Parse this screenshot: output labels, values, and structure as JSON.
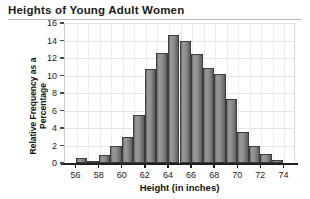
{
  "chart_data": {
    "type": "bar",
    "title": "Heights of Young Adult Women",
    "xlabel": "Height (in inches)",
    "ylabel": "Relative Frequency as a Percentage",
    "grid": true,
    "legend": "none",
    "xlim": [
      55,
      75
    ],
    "ylim": [
      0,
      16
    ],
    "ytick_step": 2,
    "xtick_step": 2,
    "bin_width": 1,
    "xticks": [
      "56",
      "58",
      "60",
      "62",
      "64",
      "66",
      "68",
      "70",
      "72",
      "74"
    ],
    "yticks": [
      "0",
      "2",
      "4",
      "6",
      "8",
      "10",
      "12",
      "14",
      "16"
    ],
    "categories": [
      "56",
      "57",
      "58",
      "59",
      "60",
      "61",
      "62",
      "63",
      "64",
      "65",
      "66",
      "67",
      "68",
      "69",
      "70",
      "71",
      "72",
      "73"
    ],
    "bin_labels": [
      "56-57",
      "57-58",
      "58-59",
      "59-60",
      "60-61",
      "61-62",
      "62-63",
      "63-64",
      "64-65",
      "65-66",
      "66-67",
      "67-68",
      "68-69",
      "69-70",
      "70-71",
      "71-72",
      "72-73",
      "73-74"
    ],
    "values": [
      0.6,
      0.2,
      0.9,
      2.0,
      3.0,
      5.5,
      10.7,
      12.6,
      14.6,
      13.9,
      12.5,
      10.9,
      10.2,
      7.3,
      3.6,
      2.0,
      1.0,
      0.4
    ]
  },
  "colors": {
    "bar_fill": "#8c8c8c",
    "bar_edge": "#3d3d3d",
    "axis": "#1f1f1f",
    "grid": "#e3e3e3",
    "text": "#1a1a1a",
    "background": "#ffffff"
  }
}
